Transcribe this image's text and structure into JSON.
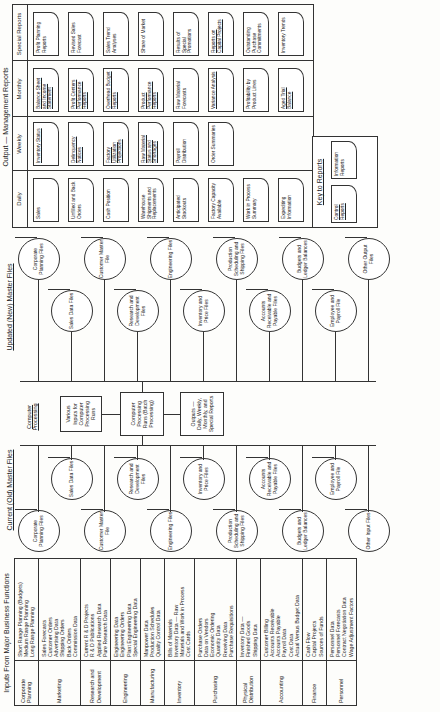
{
  "inputs": {
    "title": "Inputs From Major Business Functions",
    "rows": [
      {
        "function": "Corporate Planning",
        "data": [
          "Short Range Planning (Budgets)",
          "Medium Range Planning",
          "Long Range Planning"
        ]
      },
      {
        "function": "Marketing",
        "data": [
          "Sales Forecasts",
          "Customer Orders",
          "Advertising Data",
          "Shipping Orders",
          "Back Orders",
          "Commission Data"
        ]
      },
      {
        "function": "Research and Development",
        "data": [
          "Current R & D Projects",
          "R & D Publications",
          "Applied Research Data",
          "Pure Research Data"
        ]
      },
      {
        "function": "Engineering",
        "data": [
          "Engineering Data",
          "Engineering Orders",
          "Plant Engineering Data",
          "Special Engineering Data"
        ]
      },
      {
        "function": "Manufacturing",
        "data": [
          "Manpower Data",
          "Production Schedules",
          "Quality Control Data"
        ]
      },
      {
        "function": "Inventory",
        "data": [
          "Bills of Materials",
          "Inventory Data — Raw",
          "Materials and Work in Process",
          "Cost Cards"
        ]
      },
      {
        "function": "Purchasing",
        "data": [
          "Purchase Orders",
          "Data on Vendors",
          "Economic Ordering",
          "Quantity Data",
          "Receiving Data",
          "Purchase Requisitions"
        ]
      },
      {
        "function": "Physical Distribution",
        "data": [
          "Inventory Data —",
          "Finished Goods",
          "Shipping Data"
        ]
      },
      {
        "function": "Accounting",
        "data": [
          "Customer Billing",
          "Accounts Receivable",
          "Accounts Payable",
          "Payroll Data",
          "Cost Data",
          "Actual Versus Budget Data"
        ]
      },
      {
        "function": "Finance",
        "data": [
          "Cash Flow",
          "Capital Projects",
          "Sources of Funds"
        ]
      },
      {
        "function": "Personnel",
        "data": [
          "Personnel Data",
          "Personnel Forecasts",
          "Contract Negotiation Data",
          "Wage Adjustment Factors"
        ]
      }
    ]
  },
  "current_files": {
    "title": "Current (Old) Master Files",
    "files": [
      "Corporate Planning Files",
      "Sales Data Files",
      "Customer Master File",
      "Research and Development Files",
      "Engineering Files",
      "Inventory and Price Files",
      "Production Scheduling and Shipping Files",
      "Accounts Receivable and Payable Files",
      "Budgets and Ledger Balances",
      "Employee and Payroll File",
      "Other Input Files"
    ]
  },
  "processing": {
    "title": "Computer Processing",
    "inputs_box": "Various Inputs for Computer Processing Runs",
    "runs_box": "Computer Processing Runs (Batch Processing)",
    "outputs_box": "Outputs — Daily, Weekly, Monthly, and Special Reports"
  },
  "updated_files": {
    "title": "Updated (New) Master Files",
    "files": [
      "Corporate Planning Files",
      "Sales Data Files",
      "Customer Master File",
      "Research and Development Files",
      "Engineering Files",
      "Inventory and Price Files",
      "Production Scheduling and Shipping Files",
      "Accounts Receivable and Payable Files",
      "Budgets and Ledger Balances",
      "Employee and Payroll File",
      "Other Output Files"
    ]
  },
  "outputs": {
    "title": "Output — Management Reports",
    "columns": [
      {
        "label": "Daily",
        "reports": [
          {
            "text": "Sales",
            "type": "information"
          },
          {
            "text": "Unfilled and Back Orders",
            "type": "information"
          },
          {
            "text": "Cash Position",
            "type": "information"
          },
          {
            "text": "Warehouse Shipments and Replacements",
            "type": "information"
          },
          {
            "text": "Anticipated Stockouts",
            "type": "information"
          },
          {
            "text": "Factory Capacity Available",
            "type": "information"
          },
          {
            "text": "Work in Process Summary",
            "type": "information"
          },
          {
            "text": "Expediting Information",
            "type": "information"
          }
        ]
      },
      {
        "label": "Weekly",
        "reports": [
          {
            "text": "Inventory Status",
            "type": "control"
          },
          {
            "text": "Delinquency Notices",
            "type": "control"
          },
          {
            "text": "Factory Utilization Projections",
            "type": "control"
          },
          {
            "text": "Raw Material Status and Shortages",
            "type": "control"
          },
          {
            "text": "Payroll Distribution",
            "type": "information"
          },
          {
            "text": "Order Summaries",
            "type": "information"
          }
        ]
      },
      {
        "label": "Monthly",
        "reports": [
          {
            "text": "Balance Sheet and Income Statement",
            "type": "control"
          },
          {
            "text": "Profit Centers Performance Reports",
            "type": "control"
          },
          {
            "text": "Overhead Budget Reports",
            "type": "control"
          },
          {
            "text": "Product Performance Reports",
            "type": "control"
          },
          {
            "text": "Raw Material Forecasts",
            "type": "information"
          },
          {
            "text": "Variance Analysis",
            "type": "control"
          },
          {
            "text": "Profitability by Product Lines",
            "type": "information"
          },
          {
            "text": "Aged Trial Balance",
            "type": "control"
          }
        ]
      },
      {
        "label": "Special Reports",
        "reports": [
          {
            "text": "Profit Planning Reports",
            "type": "information"
          },
          {
            "text": "Revised Sales Forecast",
            "type": "information"
          },
          {
            "text": "Sales Trend Analyses",
            "type": "information"
          },
          {
            "text": "Share of Market",
            "type": "information"
          },
          {
            "text": "Results of Special Promotions",
            "type": "information"
          },
          {
            "text": "Reports on Capital Projects",
            "type": "control"
          },
          {
            "text": "Outstanding Purchase Commitments",
            "type": "information"
          },
          {
            "text": "Inventory Trends",
            "type": "information"
          }
        ]
      }
    ],
    "key": {
      "title": "Key to Reports",
      "control": "Control Reports",
      "information": "Information Reports"
    }
  }
}
